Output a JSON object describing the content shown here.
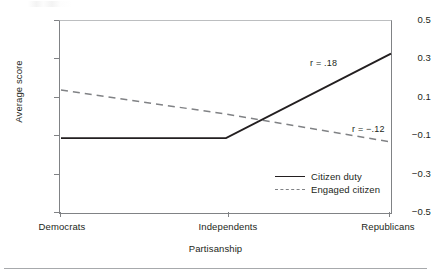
{
  "chart_data": {
    "type": "line",
    "title": "",
    "subtitle": "",
    "xlabel": "Partisanship",
    "ylabel": "Average score",
    "categories": [
      "Democrats",
      "Independents",
      "Republicans"
    ],
    "xticklabels": [
      "Democrats",
      "Independents",
      "Republicans"
    ],
    "yticklabels": [
      "0.5",
      "0.3",
      "0.1",
      "−0.1",
      "−0.3",
      "−0.5"
    ],
    "ytickvalues": [
      0.5,
      0.3,
      0.1,
      -0.1,
      -0.3,
      -0.5
    ],
    "ylim": [
      -0.5,
      0.5
    ],
    "grid": false,
    "legend_position": "inside-lower-right",
    "series": [
      {
        "name": "Citizen duty",
        "style": "solid",
        "color": "#231f20",
        "values": [
          -0.11,
          -0.11,
          0.33
        ]
      },
      {
        "name": "Engaged citizen",
        "style": "dashed",
        "color": "#808285",
        "values": [
          0.14,
          0.015,
          -0.13
        ]
      }
    ],
    "annotations": [
      {
        "text": "r = .18",
        "series": "Citizen duty"
      },
      {
        "text": "r = −.12",
        "series": "Engaged citizen"
      }
    ]
  },
  "legend": {
    "items": [
      {
        "label": "Citizen duty",
        "style": "solid"
      },
      {
        "label": "Engaged citizen",
        "style": "dashed"
      }
    ]
  },
  "axes": {
    "y_title": "Average score",
    "x_title": "Partisanship",
    "y_ticks": [
      "0.5",
      "0.3",
      "0.1",
      "−0.1",
      "−0.3",
      "−0.5"
    ],
    "x_ticks": [
      "Democrats",
      "Independents",
      "Republicans"
    ]
  },
  "annotations": {
    "r_citizen_duty": "r = .18",
    "r_engaged_citizen": "r = −.12"
  },
  "colors": {
    "citizen_duty": "#231f20",
    "engaged_citizen": "#808285",
    "axis": "#808285",
    "rule": "#a7a9ac"
  }
}
